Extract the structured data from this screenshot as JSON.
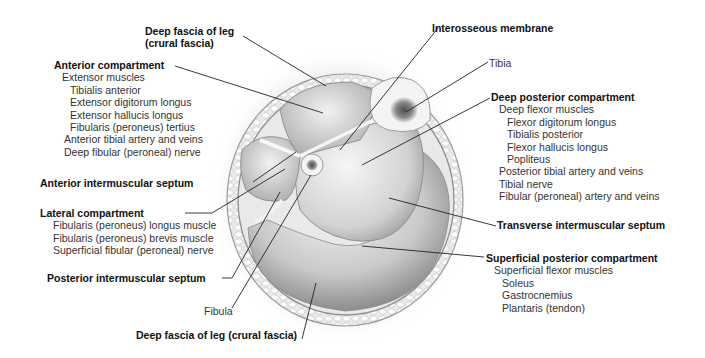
{
  "figure": {
    "colors": {
      "background": "#ffffff",
      "label_bold": "#111111",
      "label_normal": "#333333",
      "leader_line": "#222222",
      "tissue_light": "#f2f2f2",
      "tissue_mid": "#c8c8c8",
      "tissue_dark": "#8a8a8a",
      "marrow": "#5a5a5a"
    }
  },
  "labels": {
    "deep_fascia_top": {
      "line1": "Deep fascia of leg",
      "line2": "(crural fascia)"
    },
    "anterior_compartment": {
      "title": "Anterior compartment",
      "items": [
        {
          "text": "Extensor muscles",
          "indent": 1
        },
        {
          "text": "Tibialis anterior",
          "indent": 2
        },
        {
          "text": "Extensor digitorum longus",
          "indent": 2
        },
        {
          "text": "Extensor hallucis longus",
          "indent": 2
        },
        {
          "text": "Fibularis (peroneus) tertius",
          "indent": 2
        },
        {
          "text": "Anterior tibial artery and veins",
          "indent": 1
        },
        {
          "text": "Deep fibular (peroneal) nerve",
          "indent": 1
        }
      ]
    },
    "anterior_intermuscular_septum": "Anterior intermuscular septum",
    "lateral_compartment": {
      "title": "Lateral compartment",
      "items": [
        {
          "text": "Fibularis (peroneus) longus muscle",
          "indent": 1
        },
        {
          "text": "Fibularis (peroneus) brevis muscle",
          "indent": 1
        },
        {
          "text": "Superficial fibular (peroneal) nerve",
          "indent": 1
        }
      ]
    },
    "posterior_intermuscular_septum": "Posterior intermuscular septum",
    "fibula": "Fibula",
    "deep_fascia_bottom": "Deep fascia of leg (crural fascia)",
    "interosseous_membrane": "Interosseous membrane",
    "tibia": "Tibia",
    "deep_posterior_compartment": {
      "title": "Deep posterior compartment",
      "items": [
        {
          "text": "Deep flexor muscles",
          "indent": 1
        },
        {
          "text": "Flexor digitorum longus",
          "indent": 2
        },
        {
          "text": "Tibialis posterior",
          "indent": 2
        },
        {
          "text": "Flexor hallucis longus",
          "indent": 2
        },
        {
          "text": "Popliteus",
          "indent": 2
        },
        {
          "text": "Posterior tibial artery and veins",
          "indent": 1
        },
        {
          "text": "Tibial nerve",
          "indent": 1
        },
        {
          "text": "Fibular (peroneal) artery and veins",
          "indent": 1
        }
      ]
    },
    "transverse_intermuscular_septum": "Transverse intermuscular septum",
    "superficial_posterior_compartment": {
      "title": "Superficial posterior compartment",
      "items": [
        {
          "text": "Superficial flexor muscles",
          "indent": 1
        },
        {
          "text": "Soleus",
          "indent": 2
        },
        {
          "text": "Gastrocnemius",
          "indent": 2
        },
        {
          "text": "Plantaris (tendon)",
          "indent": 2
        }
      ]
    }
  }
}
